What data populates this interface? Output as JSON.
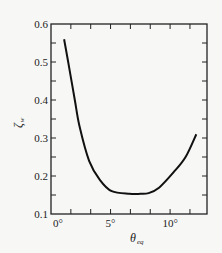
{
  "chart_data": {
    "type": "line",
    "title": "",
    "xlabel": "θ_eq",
    "ylabel": "ζ_w",
    "xlim": [
      0,
      13.1
    ],
    "ylim": [
      0.1,
      0.6
    ],
    "x_ticks": [
      {
        "value": 0,
        "label": "0°"
      },
      {
        "value": 5,
        "label": "5°"
      },
      {
        "value": 10,
        "label": "10°"
      }
    ],
    "x_minor_step": 1.667,
    "y_ticks": [
      {
        "value": 0.1,
        "label": "0.1"
      },
      {
        "value": 0.2,
        "label": "0.2"
      },
      {
        "value": 0.3,
        "label": "0.3"
      },
      {
        "value": 0.4,
        "label": "0.4"
      },
      {
        "value": 0.5,
        "label": "0.5"
      },
      {
        "value": 0.6,
        "label": "0.6"
      }
    ],
    "y_minor_step": 0.05,
    "grid": false,
    "legend": null,
    "series": [
      {
        "name": "ζ_w vs θ_eq",
        "color": "#111111",
        "x": [
          1.1,
          1.5,
          2.0,
          2.4,
          3.2,
          4.1,
          5.1,
          6.6,
          7.5,
          8.2,
          9.1,
          10.3,
          11.3,
          12.2
        ],
        "y": [
          0.56,
          0.49,
          0.4,
          0.33,
          0.24,
          0.19,
          0.16,
          0.153,
          0.153,
          0.155,
          0.17,
          0.21,
          0.25,
          0.31
        ]
      }
    ]
  },
  "labels": {
    "xlabel_main": "θ",
    "xlabel_sub": "eq",
    "ylabel_main": "ζ",
    "ylabel_sub": "w"
  }
}
